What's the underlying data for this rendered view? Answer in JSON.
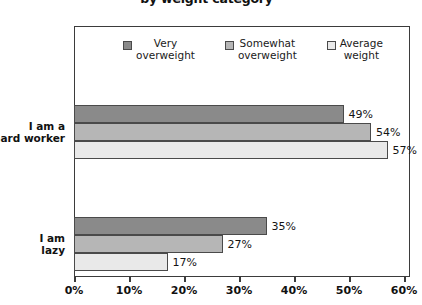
{
  "chart_data": {
    "type": "bar",
    "orientation": "horizontal",
    "title": "by weight category",
    "xlabel": "",
    "ylabel": "",
    "categories": [
      "I am a\nhard worker",
      "I am\nlazy"
    ],
    "series": [
      {
        "name": "Very\noverweight",
        "color": "#8a8a8a",
        "values": [
          49,
          35
        ],
        "labels": [
          "49%",
          "35%"
        ]
      },
      {
        "name": "Somewhat\noverweight",
        "color": "#b6b6b6",
        "values": [
          54,
          27
        ],
        "labels": [
          "54%",
          "27%"
        ]
      },
      {
        "name": "Average\nweight",
        "color": "#e9e9e9",
        "values": [
          57,
          17
        ],
        "labels": [
          "57%",
          "17%"
        ]
      }
    ],
    "xlim": [
      0,
      60
    ],
    "xticks": [
      0,
      10,
      20,
      30,
      40,
      50,
      60
    ],
    "xtick_labels": [
      "0%",
      "10%",
      "20%",
      "30%",
      "40%",
      "50%",
      "60%"
    ],
    "grid": false,
    "legend_position": "top-center",
    "value_suffix": "%"
  },
  "legend": {
    "items": [
      {
        "label": "Very\noverweight",
        "color": "#8a8a8a"
      },
      {
        "label": "Somewhat\noverweight",
        "color": "#b6b6b6"
      },
      {
        "label": "Average\nweight",
        "color": "#e9e9e9"
      }
    ]
  },
  "axis": {
    "x_tick_labels": [
      "0%",
      "10%",
      "20%",
      "30%",
      "40%",
      "50%",
      "60%"
    ]
  },
  "colors": {
    "frame": "#3b3b3b",
    "bar_border": "#4a4a4a",
    "text": "#111111",
    "background": "#ffffff"
  }
}
